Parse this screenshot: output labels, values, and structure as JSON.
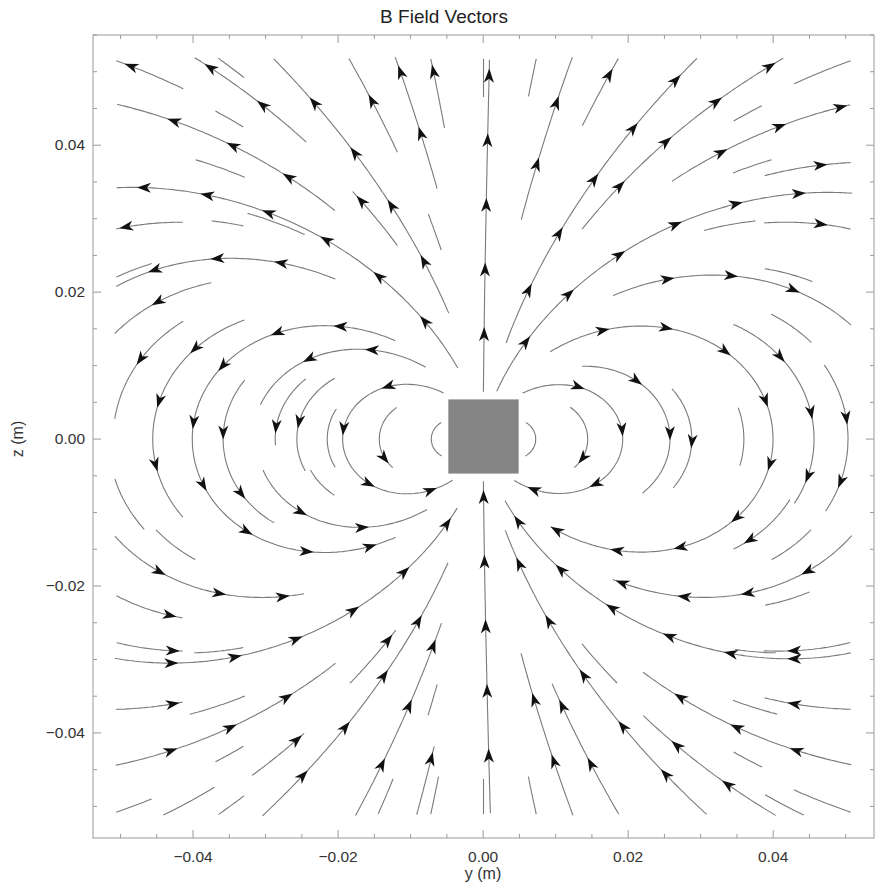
{
  "chart_data": {
    "type": "streamplot",
    "title": "B Field Vectors",
    "xlabel": "y (m)",
    "ylabel": "z (m)",
    "xlim": [
      -0.0538,
      0.0539
    ],
    "ylim": [
      -0.0543,
      0.055
    ],
    "xticks": [
      {
        "value": -0.04,
        "label": "−0.04"
      },
      {
        "value": -0.02,
        "label": "−0.02"
      },
      {
        "value": 0.0,
        "label": "0.00"
      },
      {
        "value": 0.02,
        "label": "0.02"
      },
      {
        "value": 0.04,
        "label": "0.04"
      }
    ],
    "yticks": [
      {
        "value": 0.04,
        "label": "0.04"
      },
      {
        "value": 0.02,
        "label": "0.02"
      },
      {
        "value": 0.0,
        "label": "0.00"
      },
      {
        "value": -0.02,
        "label": "−0.02"
      },
      {
        "value": -0.04,
        "label": "−0.04"
      }
    ],
    "minor_tick_step": 0.005,
    "grid": false,
    "legend": null,
    "field": {
      "kind": "magnetic dipole",
      "moment_direction": "+z",
      "description": "Field lines exit the top of the magnet, loop around both sides, and re-enter from the bottom"
    },
    "magnet": {
      "y_range": [
        -0.0048,
        0.0049
      ],
      "z_range": [
        -0.0047,
        0.0054
      ],
      "color": "#858585"
    },
    "colors": {
      "streamline": "#7a7a7a",
      "arrow": "#111111",
      "frame": "#9a9a9a",
      "background": "#ffffff"
    }
  }
}
